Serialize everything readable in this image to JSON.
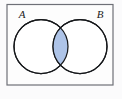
{
  "figure": {
    "name": "venn-diagram-two-sets-intersection",
    "background_color": "#fbfbfc"
  },
  "universal_set_box": {
    "name": "universal-set-rectangle",
    "stroke_color": "#6e7077",
    "fill_color": "#fdfdfd",
    "x": 7,
    "y": 4.5,
    "width": 106,
    "height": 80.5
  },
  "labels": {
    "set_a": "A",
    "set_b": "B"
  },
  "circles": [
    {
      "name": "circle-set-a",
      "label": "A",
      "cx": 41,
      "cy": 46.5,
      "r": 27,
      "stroke_color": "#16181b",
      "fill_color": "#ffffff"
    },
    {
      "name": "circle-set-b",
      "label": "B",
      "cx": 80,
      "cy": 46.5,
      "r": 27,
      "stroke_color": "#16181b",
      "fill_color": "#ffffff"
    }
  ],
  "intersection": {
    "name": "intersection-region-a-and-b",
    "shaded": true,
    "fill_color": "#aec4e8",
    "stroke_color": "#16181b"
  },
  "chart_data": {
    "type": "diagram",
    "diagram_type": "venn",
    "title": "",
    "sets": [
      "A",
      "B"
    ],
    "highlighted_region": "A ∩ B",
    "regions": [
      {
        "id": "A-only",
        "label": "A only",
        "shaded": false
      },
      {
        "id": "A-and-B",
        "label": "A ∩ B",
        "shaded": true
      },
      {
        "id": "B-only",
        "label": "B only",
        "shaded": false
      },
      {
        "id": "outside",
        "label": "Universal set remainder",
        "shaded": false
      }
    ],
    "legend": [],
    "annotations": [
      "A",
      "B"
    ]
  }
}
